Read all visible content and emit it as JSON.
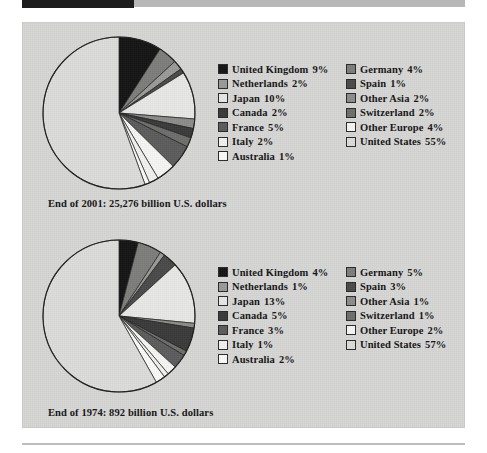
{
  "figure": {
    "panel_bg": "#d6d6d4",
    "charts": [
      {
        "caption": "End of 2001: 25,276 billion U.S. dollars",
        "total_label": "25,276 billion U.S. dollars",
        "year_label": "End of 2001",
        "legend_left": [
          {
            "label": "United Kingdom",
            "pct": "9%",
            "color": "#141414"
          },
          {
            "label": "Netherlands",
            "pct": "2%",
            "color": "#9a9a98"
          },
          {
            "label": "Japan",
            "pct": "10%",
            "color": "#e8e8e6"
          },
          {
            "label": "Canada",
            "pct": "2%",
            "color": "#3a3a3a"
          },
          {
            "label": "France",
            "pct": "5%",
            "color": "#5c5c5c"
          },
          {
            "label": "Italy",
            "pct": "2%",
            "color": "#f2f2f0"
          },
          {
            "label": "Australia",
            "pct": "1%",
            "color": "#fbfbf9"
          }
        ],
        "legend_right": [
          {
            "label": "Germany",
            "pct": "4%",
            "color": "#7d7d7b"
          },
          {
            "label": "Spain",
            "pct": "1%",
            "color": "#4a4a4a"
          },
          {
            "label": "Other Asia",
            "pct": "2%",
            "color": "#8c8c8a"
          },
          {
            "label": "Switzerland",
            "pct": "2%",
            "color": "#6e6e6c"
          },
          {
            "label": "Other Europe",
            "pct": "4%",
            "color": "#f6f6f4"
          },
          {
            "label": "United States",
            "pct": "55%",
            "color": "#dcdcda"
          }
        ]
      },
      {
        "caption": "End of 1974: 892 billion U.S. dollars",
        "total_label": "892 billion U.S. dollars",
        "year_label": "End of 1974",
        "legend_left": [
          {
            "label": "United Kingdom",
            "pct": "4%",
            "color": "#141414"
          },
          {
            "label": "Netherlands",
            "pct": "1%",
            "color": "#9a9a98"
          },
          {
            "label": "Japan",
            "pct": "13%",
            "color": "#e8e8e6"
          },
          {
            "label": "Canada",
            "pct": "5%",
            "color": "#3a3a3a"
          },
          {
            "label": "France",
            "pct": "3%",
            "color": "#5c5c5c"
          },
          {
            "label": "Italy",
            "pct": "1%",
            "color": "#f2f2f0"
          },
          {
            "label": "Australia",
            "pct": "2%",
            "color": "#fbfbf9"
          }
        ],
        "legend_right": [
          {
            "label": "Germany",
            "pct": "5%",
            "color": "#7d7d7b"
          },
          {
            "label": "Spain",
            "pct": "3%",
            "color": "#4a4a4a"
          },
          {
            "label": "Other Asia",
            "pct": "1%",
            "color": "#8c8c8a"
          },
          {
            "label": "Switzerland",
            "pct": "1%",
            "color": "#6e6e6c"
          },
          {
            "label": "Other Europe",
            "pct": "2%",
            "color": "#f6f6f4"
          },
          {
            "label": "United States",
            "pct": "57%",
            "color": "#dcdcda"
          }
        ]
      }
    ]
  },
  "chart_data": [
    {
      "type": "pie",
      "title": "End of 2001: 25,276 billion U.S. dollars",
      "unit": "percent of total",
      "total": "25,276 billion U.S. dollars",
      "legend_position": "right",
      "start_angle_deg": 0,
      "direction": "clockwise",
      "labels": [
        "United Kingdom",
        "Germany",
        "Netherlands",
        "Spain",
        "Japan",
        "Other Asia",
        "Canada",
        "Switzerland",
        "France",
        "Other Europe",
        "Italy",
        "United States",
        "Australia"
      ],
      "values": [
        9,
        4,
        2,
        1,
        10,
        2,
        2,
        2,
        5,
        4,
        2,
        55,
        1
      ],
      "slices": [
        {
          "label": "United Kingdom",
          "value": 9,
          "color": "#141414"
        },
        {
          "label": "Germany",
          "value": 4,
          "color": "#7d7d7b"
        },
        {
          "label": "Netherlands",
          "value": 2,
          "color": "#9a9a98"
        },
        {
          "label": "Spain",
          "value": 1,
          "color": "#4a4a4a"
        },
        {
          "label": "Japan",
          "value": 10,
          "color": "#e8e8e6"
        },
        {
          "label": "Other Asia",
          "value": 2,
          "color": "#8c8c8a"
        },
        {
          "label": "Canada",
          "value": 2,
          "color": "#3a3a3a"
        },
        {
          "label": "Switzerland",
          "value": 2,
          "color": "#6e6e6c"
        },
        {
          "label": "France",
          "value": 5,
          "color": "#5c5c5c"
        },
        {
          "label": "Other Europe",
          "value": 4,
          "color": "#f6f6f4"
        },
        {
          "label": "Italy",
          "value": 2,
          "color": "#f2f2f0"
        },
        {
          "label": "Australia",
          "value": 1,
          "color": "#fbfbf9"
        },
        {
          "label": "United States",
          "value": 55,
          "color": "#dcdcda"
        }
      ]
    },
    {
      "type": "pie",
      "title": "End of 1974: 892 billion U.S. dollars",
      "unit": "percent of total",
      "total": "892 billion U.S. dollars",
      "legend_position": "right",
      "start_angle_deg": 0,
      "direction": "clockwise",
      "labels": [
        "United Kingdom",
        "Germany",
        "Netherlands",
        "Spain",
        "Japan",
        "Other Asia",
        "Canada",
        "Switzerland",
        "France",
        "Other Europe",
        "Italy",
        "United States",
        "Australia"
      ],
      "values": [
        4,
        5,
        1,
        3,
        13,
        1,
        5,
        1,
        3,
        2,
        1,
        57,
        2
      ],
      "slices": [
        {
          "label": "United Kingdom",
          "value": 4,
          "color": "#141414"
        },
        {
          "label": "Germany",
          "value": 5,
          "color": "#7d7d7b"
        },
        {
          "label": "Netherlands",
          "value": 1,
          "color": "#9a9a98"
        },
        {
          "label": "Spain",
          "value": 3,
          "color": "#4a4a4a"
        },
        {
          "label": "Japan",
          "value": 13,
          "color": "#e8e8e6"
        },
        {
          "label": "Other Asia",
          "value": 1,
          "color": "#8c8c8a"
        },
        {
          "label": "Canada",
          "value": 5,
          "color": "#3a3a3a"
        },
        {
          "label": "Switzerland",
          "value": 1,
          "color": "#6e6e6c"
        },
        {
          "label": "France",
          "value": 3,
          "color": "#5c5c5c"
        },
        {
          "label": "Other Europe",
          "value": 2,
          "color": "#f6f6f4"
        },
        {
          "label": "Italy",
          "value": 1,
          "color": "#f2f2f0"
        },
        {
          "label": "Australia",
          "value": 2,
          "color": "#fbfbf9"
        },
        {
          "label": "United States",
          "value": 57,
          "color": "#dcdcda"
        }
      ]
    }
  ]
}
